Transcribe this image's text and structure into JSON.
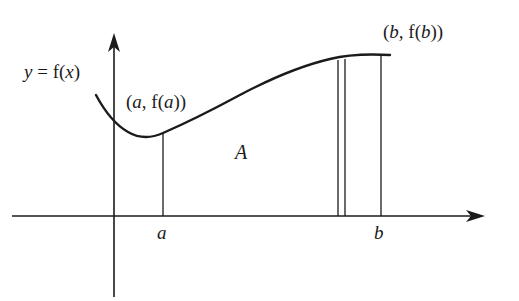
{
  "figure": {
    "kind": "calculus-area-under-curve-diagram",
    "background_color": "#ffffff",
    "stroke_color": "#1b1b1b",
    "labels": {
      "function_label": "y = f(x)",
      "point_a_label": "(a, f(a))",
      "point_b_label": "(b, f(b))",
      "area_label": "A",
      "tick_a_label": "a",
      "tick_b_label": "b"
    }
  },
  "chart_data": {
    "type": "line",
    "title": "",
    "subtitle": "",
    "xlabel": "",
    "ylabel": "",
    "grid": false,
    "legend": null,
    "annotations": [
      {
        "name": "function-label",
        "text": "y = f(x)",
        "x_px": 24,
        "y_px": 62
      },
      {
        "name": "point-a-label",
        "text": "(a, f(a))",
        "x_px": 126,
        "y_px": 92
      },
      {
        "name": "point-b-label",
        "text": "(b, f(b))",
        "x_px": 383,
        "y_px": 22
      },
      {
        "name": "area-label",
        "text": "A",
        "x_px": 235,
        "y_px": 142
      },
      {
        "name": "tick-a-label",
        "text": "a",
        "x_px": 157,
        "y_px": 223
      },
      {
        "name": "tick-b-label",
        "text": "b",
        "x_px": 374,
        "y_px": 223
      }
    ],
    "axes": {
      "x_axis": {
        "from_px": [
          12,
          216
        ],
        "to_px": [
          485,
          216
        ],
        "arrow": "right"
      },
      "y_axis": {
        "from_px": [
          114,
          297
        ],
        "to_px": [
          114,
          33
        ],
        "arrow": "up"
      },
      "origin_px": [
        114,
        216
      ]
    },
    "series": [
      {
        "name": "f(x)",
        "kind": "curve",
        "points_px": [
          [
            96,
            95
          ],
          [
            108,
            112
          ],
          [
            120,
            126
          ],
          [
            134,
            135
          ],
          [
            148,
            137
          ],
          [
            163,
            133
          ],
          [
            182,
            125
          ],
          [
            205,
            113
          ],
          [
            232,
            99
          ],
          [
            262,
            85
          ],
          [
            292,
            73
          ],
          [
            322,
            63
          ],
          [
            350,
            57
          ],
          [
            372,
            55
          ],
          [
            390,
            55
          ]
        ]
      }
    ],
    "verticals_px": [
      {
        "name": "ordinate-at-a",
        "x": 163,
        "y_top": 133,
        "y_bottom": 216
      },
      {
        "name": "strip-left-edge",
        "x": 338,
        "y_top": 60,
        "y_bottom": 216
      },
      {
        "name": "strip-right-edge",
        "x": 345,
        "y_top": 59,
        "y_bottom": 216
      },
      {
        "name": "ordinate-at-b",
        "x": 381,
        "y_top": 55,
        "y_bottom": 216
      }
    ]
  }
}
